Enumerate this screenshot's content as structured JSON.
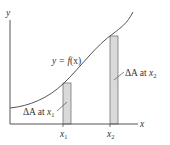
{
  "diagram": {
    "axes": {
      "x_label": "x",
      "y_label": "y"
    },
    "curve_label": {
      "prefix": "y = ",
      "func": "f",
      "arg": "(x)"
    },
    "strips": [
      {
        "tick_label": "x",
        "tick_sub": "1",
        "annotation_prefix": "ΔA at ",
        "annotation_var": "x",
        "annotation_sub": "1"
      },
      {
        "tick_label": "x",
        "tick_sub": "2",
        "annotation_prefix": "ΔA at ",
        "annotation_var": "x",
        "annotation_sub": "2"
      }
    ],
    "colors": {
      "axis": "#555555",
      "curve": "#555555",
      "strip_fill": "#d9d9d9",
      "strip_stroke": "#777777",
      "text": "#333333"
    }
  }
}
